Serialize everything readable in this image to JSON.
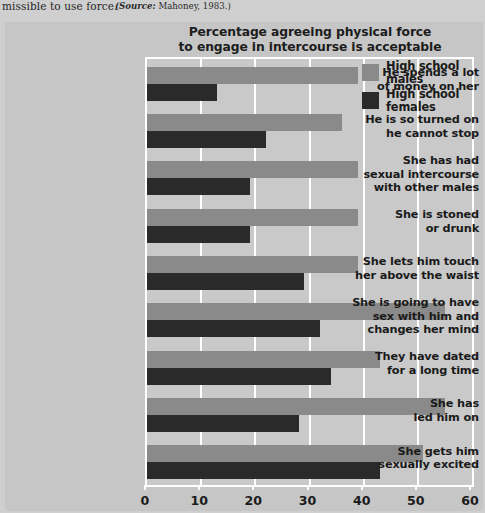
{
  "caption": {
    "text": "missible to use force.",
    "source_label": "(Source:",
    "source_value": " Mahoney, 1983.)"
  },
  "chart_title_line1": "Percentage agreeing physical force",
  "chart_title_line2": "to engage in intercourse is acceptable",
  "legend": {
    "items": [
      {
        "label_line1": "High school",
        "label_line2": "males",
        "color": "#8a8a8a",
        "key": "males"
      },
      {
        "label_line1": "High school",
        "label_line2": "females",
        "color": "#2a2a2a",
        "key": "females"
      }
    ]
  },
  "axis": {
    "tick_labels": [
      "0",
      "10",
      "20",
      "30",
      "40",
      "50",
      "60"
    ]
  },
  "chart_data": {
    "type": "bar",
    "orientation": "horizontal",
    "title": "Percentage agreeing physical force to engage in intercourse is acceptable",
    "xlabel": "",
    "ylabel": "",
    "xlim": [
      0,
      60
    ],
    "xticks": [
      0,
      10,
      20,
      30,
      40,
      50,
      60
    ],
    "grid": true,
    "legend_position": "top-right",
    "categories": [
      "He spends a lot of money on her",
      "He is so turned on he cannot stop",
      "She has had sexual intercourse with other males",
      "She is stoned or drunk",
      "She lets him touch her above the waist",
      "She is going to have sex with him and changes her mind",
      "They have dated for a long time",
      "She has led him on",
      "She gets him sexually excited"
    ],
    "category_lines": [
      [
        "He spends a lot",
        "of money on her"
      ],
      [
        "He is so turned on",
        "he cannot stop"
      ],
      [
        "She has had",
        "sexual intercourse",
        "with other males"
      ],
      [
        "She is stoned",
        "or drunk"
      ],
      [
        "She lets him touch",
        "her above the waist"
      ],
      [
        "She is going to have",
        "sex with him and",
        "changes her mind"
      ],
      [
        "They have dated",
        "for a long time"
      ],
      [
        "She has",
        "led him on"
      ],
      [
        "She gets him",
        "sexually excited"
      ]
    ],
    "series": [
      {
        "name": "High school males",
        "color": "#8a8a8a",
        "values": [
          39,
          36,
          39,
          39,
          39,
          55,
          43,
          55,
          51
        ]
      },
      {
        "name": "High school females",
        "color": "#2a2a2a",
        "values": [
          13,
          22,
          19,
          19,
          29,
          32,
          34,
          28,
          43
        ]
      }
    ]
  }
}
